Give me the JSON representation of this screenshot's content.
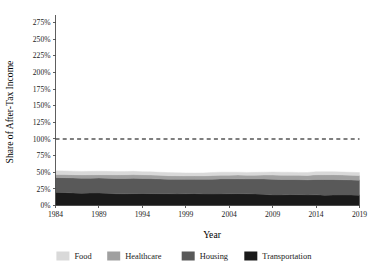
{
  "chart_data": {
    "type": "area",
    "stacked": true,
    "title": "",
    "xlabel": "Year",
    "ylabel": "Share of After-Tax Income",
    "xlim": [
      1984,
      2019
    ],
    "ylim": [
      0,
      287
    ],
    "xticks": [
      1984,
      1989,
      1994,
      1999,
      2004,
      2009,
      2014,
      2019
    ],
    "xtick_labels": [
      "1984",
      "1989",
      "1994",
      "1999",
      "2004",
      "2009",
      "2014",
      "2019"
    ],
    "yticks": [
      0,
      25,
      50,
      75,
      100,
      125,
      150,
      175,
      200,
      225,
      250,
      275
    ],
    "ytick_labels": [
      "0%",
      "25%",
      "50%",
      "75%",
      "100%",
      "125%",
      "150%",
      "175%",
      "200%",
      "225%",
      "250%",
      "275%"
    ],
    "grid": false,
    "legend_position": "bottom",
    "reference_lines": [
      {
        "name": "full-income-line",
        "y": 100,
        "style": "dashed",
        "color": "#000000"
      }
    ],
    "x": [
      1984,
      1985,
      1986,
      1987,
      1988,
      1989,
      1990,
      1991,
      1992,
      1993,
      1994,
      1995,
      1996,
      1997,
      1998,
      1999,
      2000,
      2001,
      2002,
      2003,
      2004,
      2005,
      2006,
      2007,
      2008,
      2009,
      2010,
      2011,
      2012,
      2013,
      2014,
      2015,
      2016,
      2017,
      2018,
      2019
    ],
    "series": [
      {
        "name": "Transportation",
        "color": "#1a1a1a",
        "values": [
          20.0,
          19.6,
          18.8,
          18.3,
          18.6,
          18.8,
          18.4,
          17.6,
          17.5,
          17.8,
          18.0,
          17.8,
          17.7,
          17.6,
          17.4,
          17.6,
          17.9,
          17.3,
          17.2,
          17.4,
          17.6,
          17.8,
          17.5,
          17.3,
          17.0,
          15.8,
          15.9,
          16.4,
          16.3,
          15.9,
          16.0,
          15.4,
          15.6,
          15.8,
          15.7,
          15.5
        ]
      },
      {
        "name": "Housing",
        "color": "#595959",
        "values": [
          22.0,
          22.2,
          22.6,
          22.8,
          22.5,
          22.4,
          22.6,
          23.1,
          23.2,
          23.0,
          22.6,
          22.6,
          22.3,
          22.0,
          22.1,
          21.8,
          21.5,
          22.0,
          22.4,
          22.6,
          22.4,
          22.3,
          22.4,
          22.6,
          22.9,
          23.6,
          23.3,
          22.8,
          22.6,
          22.7,
          23.2,
          23.6,
          23.4,
          23.0,
          22.8,
          22.6
        ]
      },
      {
        "name": "Healthcare",
        "color": "#a0a0a0",
        "values": [
          4.6,
          4.7,
          4.9,
          4.9,
          5.0,
          5.1,
          5.2,
          5.4,
          5.5,
          5.6,
          5.5,
          5.4,
          5.3,
          5.2,
          5.2,
          5.1,
          5.1,
          5.2,
          5.4,
          5.5,
          5.6,
          5.6,
          5.5,
          5.6,
          5.8,
          6.3,
          6.4,
          6.3,
          6.4,
          6.6,
          6.9,
          7.2,
          7.3,
          7.1,
          7.0,
          7.0
        ]
      },
      {
        "name": "Food",
        "color": "#d9d9d9",
        "values": [
          5.6,
          5.5,
          5.3,
          5.2,
          5.2,
          5.2,
          5.1,
          5.1,
          5.0,
          4.9,
          4.8,
          4.8,
          4.7,
          4.6,
          4.6,
          4.5,
          4.4,
          4.5,
          4.6,
          4.6,
          4.5,
          4.4,
          4.3,
          4.3,
          4.4,
          4.6,
          4.5,
          4.5,
          4.4,
          4.4,
          4.6,
          4.7,
          4.6,
          4.5,
          4.4,
          4.4
        ]
      }
    ],
    "series_draw_order": [
      "Transportation",
      "Housing",
      "Healthcare",
      "Food"
    ],
    "legend": [
      {
        "label": "Food",
        "color": "#d9d9d9"
      },
      {
        "label": "Healthcare",
        "color": "#a0a0a0"
      },
      {
        "label": "Housing",
        "color": "#595959"
      },
      {
        "label": "Transportation",
        "color": "#1a1a1a"
      }
    ]
  }
}
